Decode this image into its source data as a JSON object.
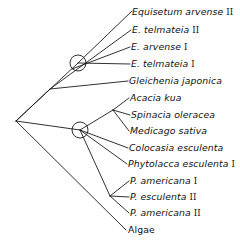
{
  "figure": {
    "type": "phylogenetic-tree",
    "background_color": "#ffffff",
    "line_color": "#1a1a1a"
  },
  "taxa": [
    {
      "id": "equisetum-arvense-2",
      "genus": "Equisetum arvense",
      "numeral": "II",
      "label": "Equisetum arvense II",
      "x": 132,
      "y": 15,
      "style": "italic"
    },
    {
      "id": "e-telmateia-2",
      "genus": "E. telmateia",
      "numeral": "II",
      "label": "E. telmateia II",
      "x": 132,
      "y": 33,
      "style": "italic"
    },
    {
      "id": "e-arvense-1",
      "genus": "E. arvense",
      "numeral": "I",
      "label": "E. arvense I",
      "x": 131,
      "y": 50,
      "style": "italic"
    },
    {
      "id": "e-telmateia-1",
      "genus": "E. telmateia",
      "numeral": "I",
      "label": "E. telmateia I",
      "x": 131,
      "y": 67,
      "style": "italic"
    },
    {
      "id": "gleichenia-japonica",
      "genus": "Gleichenia japonica",
      "numeral": "",
      "label": "Gleichenia japonica",
      "x": 129,
      "y": 84,
      "style": "italic"
    },
    {
      "id": "acacia-kua",
      "genus": "Acacia kua",
      "numeral": "",
      "label": "Acacia kua",
      "x": 130,
      "y": 101,
      "style": "italic"
    },
    {
      "id": "spinacia-oleracea",
      "genus": "Spinacia oleracea",
      "numeral": "",
      "label": "Spinacia oleracea",
      "x": 131,
      "y": 118,
      "style": "italic"
    },
    {
      "id": "medicago-sativa",
      "genus": "Medicago sativa",
      "numeral": "",
      "label": "Medicago sativa",
      "x": 130,
      "y": 134,
      "style": "italic"
    },
    {
      "id": "colocasia-esculenta",
      "genus": "Colocasia esculenta",
      "numeral": "",
      "label": "Colocasia esculenta",
      "x": 129,
      "y": 151,
      "style": "italic"
    },
    {
      "id": "phytolacca-esculenta-1",
      "genus": "Phytolacca esculenta",
      "numeral": "I",
      "label": "Phytolacca esculenta I",
      "x": 128,
      "y": 167,
      "style": "italic"
    },
    {
      "id": "p-americana-1",
      "genus": "P. americana",
      "numeral": "I",
      "label": "P. americana I",
      "x": 130,
      "y": 184,
      "style": "italic"
    },
    {
      "id": "p-esculenta-2",
      "genus": "P. esculenta",
      "numeral": "II",
      "label": "P. esculenta II",
      "x": 130,
      "y": 200,
      "style": "italic"
    },
    {
      "id": "p-americana-2",
      "genus": "P. americana",
      "numeral": "II",
      "label": "P. americana II",
      "x": 130,
      "y": 216,
      "style": "italic"
    },
    {
      "id": "algae",
      "genus": "Algae",
      "numeral": "",
      "label": "Algae",
      "x": 128,
      "y": 233,
      "style": "upright"
    }
  ],
  "nodes": {
    "root": {
      "name": "root-node",
      "x": 16,
      "y": 121,
      "circled": false
    },
    "equisetum_node": {
      "name": "equisetum-clade-node",
      "x": 78,
      "y": 63,
      "circled": true,
      "radius": 8
    },
    "angiosperm_node": {
      "name": "angiosperm-clade-node",
      "x": 80,
      "y": 130,
      "circled": true,
      "radius": 8
    },
    "fern_junction": {
      "name": "fern-junction",
      "x": 50,
      "y": 89,
      "circled": false
    },
    "legume_junction": {
      "name": "legume-junction",
      "x": 113,
      "y": 110,
      "circled": false
    },
    "phyto_junction": {
      "name": "phytolacca-junction",
      "x": 110,
      "y": 196,
      "circled": false
    }
  },
  "branches": [
    {
      "name": "root-to-equisetum-node",
      "x1": 16,
      "y1": 121,
      "x2": 78,
      "y2": 63
    },
    {
      "name": "equisetum-node-to-arvense2",
      "x1": 78,
      "y1": 63,
      "x2": 132,
      "y2": 11
    },
    {
      "name": "equisetum-node-to-telmateia1",
      "x1": 78,
      "y1": 63,
      "x2": 130,
      "y2": 64
    },
    {
      "name": "fernline-to-telmateia2",
      "x1": 50,
      "y1": 89,
      "x2": 131,
      "y2": 30
    },
    {
      "name": "fernline-to-arvense1",
      "x1": 72,
      "y1": 69,
      "x2": 130,
      "y2": 47
    },
    {
      "name": "root-to-fern-junction",
      "x1": 16,
      "y1": 121,
      "x2": 50,
      "y2": 89
    },
    {
      "name": "fern-junction-to-gleichenia",
      "x1": 50,
      "y1": 89,
      "x2": 128,
      "y2": 81
    },
    {
      "name": "root-to-angiosperm-node",
      "x1": 16,
      "y1": 121,
      "x2": 80,
      "y2": 130
    },
    {
      "name": "angiosperm-to-legume-junction",
      "x1": 80,
      "y1": 130,
      "x2": 113,
      "y2": 110
    },
    {
      "name": "legume-junction-to-acacia",
      "x1": 113,
      "y1": 110,
      "x2": 129,
      "y2": 98
    },
    {
      "name": "legume-junction-to-spinacia",
      "x1": 113,
      "y1": 110,
      "x2": 130,
      "y2": 115
    },
    {
      "name": "legume-junction-to-medicago",
      "x1": 113,
      "y1": 110,
      "x2": 129,
      "y2": 131
    },
    {
      "name": "angiosperm-to-colocasia",
      "x1": 80,
      "y1": 130,
      "x2": 128,
      "y2": 148
    },
    {
      "name": "angiosperm-to-phytolacca1",
      "x1": 80,
      "y1": 130,
      "x2": 127,
      "y2": 164
    },
    {
      "name": "angiosperm-to-phyto-junction",
      "x1": 80,
      "y1": 130,
      "x2": 110,
      "y2": 196
    },
    {
      "name": "phyto-junction-to-americana1",
      "x1": 110,
      "y1": 196,
      "x2": 129,
      "y2": 181
    },
    {
      "name": "phyto-junction-to-esculenta2",
      "x1": 110,
      "y1": 196,
      "x2": 129,
      "y2": 197
    },
    {
      "name": "phyto-junction-to-americana2",
      "x1": 110,
      "y1": 196,
      "x2": 129,
      "y2": 213
    },
    {
      "name": "root-to-algae",
      "x1": 16,
      "y1": 121,
      "x2": 126,
      "y2": 230
    }
  ]
}
